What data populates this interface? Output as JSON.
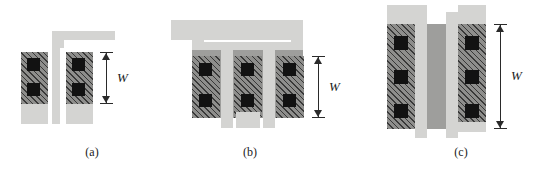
{
  "figure": {
    "width": 552,
    "height": 175,
    "background": "#ffffff",
    "colors": {
      "poly_light_gray": "#d4d4d2",
      "diffusion_mid_gray": "#9e9e9c",
      "active_hatched_gray": "#8e8e8c",
      "via_black": "#121212",
      "ink": "#2a2a2a"
    },
    "dimension_symbol": "W",
    "panels": [
      {
        "id": "a",
        "caption": "(a)",
        "description": "single-finger layout with two contacted active blocks",
        "active_blocks": 2,
        "vias_per_block": 2,
        "gate_fingers": 1,
        "width_label": "W"
      },
      {
        "id": "b",
        "caption": "(b)",
        "description": "two-finger layout with three contacted active blocks",
        "active_blocks": 3,
        "vias_per_block": 2,
        "gate_fingers": 2,
        "width_label": "W"
      },
      {
        "id": "c",
        "caption": "(c)",
        "description": "tall single-device layout with three vias per block",
        "active_blocks": 2,
        "vias_per_block": 3,
        "gate_fingers": 2,
        "width_label": "W"
      }
    ]
  }
}
